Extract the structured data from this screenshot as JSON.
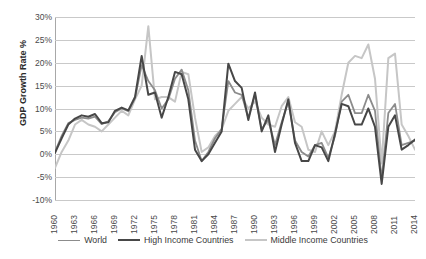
{
  "chart_data": {
    "type": "line",
    "title": "",
    "xlabel": "",
    "ylabel": "GDP Growth Rate %",
    "ylim": [
      -10,
      30
    ],
    "ytick_values": [
      30,
      25,
      20,
      15,
      10,
      5,
      0,
      -5,
      -10
    ],
    "ytick_labels": [
      "30%",
      "25%",
      "20%",
      "15%",
      "10%",
      "5%",
      "0%",
      "-5%",
      "-10%"
    ],
    "grid": true,
    "legend_position": "bottom",
    "x": [
      1960,
      1961,
      1962,
      1963,
      1964,
      1965,
      1966,
      1967,
      1968,
      1969,
      1970,
      1971,
      1972,
      1973,
      1974,
      1975,
      1976,
      1977,
      1978,
      1979,
      1980,
      1981,
      1982,
      1983,
      1984,
      1985,
      1986,
      1987,
      1988,
      1989,
      1990,
      1991,
      1992,
      1993,
      1994,
      1995,
      1996,
      1997,
      1998,
      1999,
      2000,
      2001,
      2002,
      2003,
      2004,
      2005,
      2006,
      2007,
      2008,
      2009,
      2010,
      2011,
      2012,
      2013,
      2014
    ],
    "xtick_labels": [
      "1960",
      "1963",
      "1966",
      "1969",
      "1972",
      "1975",
      "1978",
      "1981",
      "1984",
      "1987",
      "1990",
      "1993",
      "1996",
      "1999",
      "2002",
      "2005",
      "2008",
      "2011",
      "2014"
    ],
    "xtick_step": 3,
    "series": [
      {
        "name": "World",
        "color": "#8c8c8c",
        "width": 1.8,
        "values": [
          0.5,
          4.0,
          6.8,
          7.5,
          8.0,
          7.8,
          8.2,
          6.6,
          7.2,
          9.2,
          10.0,
          9.4,
          12.2,
          19.5,
          16.0,
          14.0,
          10.0,
          12.0,
          16.5,
          18.5,
          14.0,
          3.0,
          -1.5,
          0.5,
          3.5,
          5.5,
          16.0,
          13.5,
          13.0,
          8.0,
          13.0,
          5.5,
          7.5,
          2.0,
          7.0,
          11.5,
          3.0,
          0.5,
          -0.5,
          2.0,
          2.5,
          -0.8,
          4.0,
          11.5,
          13.0,
          9.0,
          9.0,
          13.0,
          9.5,
          -5.5,
          9.0,
          11.0,
          2.0,
          2.5,
          3.0
        ]
      },
      {
        "name": "High Income Countries",
        "color": "#474747",
        "width": 2.0,
        "values": [
          0.3,
          3.5,
          6.5,
          7.8,
          8.5,
          8.2,
          8.8,
          6.8,
          7.0,
          9.5,
          10.2,
          9.6,
          12.5,
          21.5,
          13.0,
          13.5,
          8.0,
          12.5,
          18.0,
          17.5,
          12.0,
          1.0,
          -1.5,
          0.0,
          2.5,
          5.0,
          19.8,
          16.0,
          14.5,
          7.5,
          13.5,
          5.0,
          8.5,
          0.5,
          6.5,
          12.0,
          2.5,
          -1.5,
          -1.5,
          2.0,
          1.5,
          -1.5,
          4.5,
          11.0,
          10.5,
          6.5,
          6.5,
          10.0,
          6.0,
          -6.5,
          6.0,
          8.5,
          1.0,
          2.0,
          3.2
        ]
      },
      {
        "name": "Middle Income Countries",
        "color": "#c6c6c6",
        "width": 2.0,
        "values": [
          -3.0,
          0.5,
          3.0,
          6.5,
          7.5,
          6.5,
          6.0,
          5.0,
          6.5,
          8.0,
          9.5,
          8.5,
          12.0,
          15.0,
          28.0,
          12.0,
          12.5,
          12.5,
          11.5,
          18.0,
          17.5,
          8.0,
          0.5,
          1.5,
          4.0,
          5.5,
          9.5,
          11.0,
          12.5,
          10.0,
          11.5,
          8.0,
          6.5,
          6.0,
          10.5,
          12.5,
          7.0,
          6.0,
          1.0,
          0.5,
          5.0,
          2.0,
          5.0,
          13.0,
          20.0,
          21.5,
          21.0,
          24.0,
          16.5,
          -2.0,
          21.0,
          22.0,
          6.5,
          4.0,
          1.0
        ]
      }
    ]
  }
}
